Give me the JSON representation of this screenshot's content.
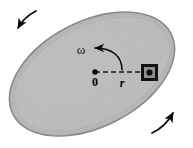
{
  "figure": {
    "type": "physics-diagram",
    "canvas": {
      "width": 193,
      "height": 148,
      "background": "#ffffff"
    }
  },
  "disk": {
    "name": "rotating-disk",
    "shape": "ellipse",
    "center_x": 92,
    "center_y": 74,
    "radius_x": 88,
    "radius_y": 52,
    "rotation_deg": -27,
    "fill_color": "#b9b9b9",
    "rim_color": "#8a8a8a",
    "rim_width": 4,
    "texture": "speckled-gray"
  },
  "origin": {
    "name": "disk-center",
    "label": "0",
    "x": 95,
    "y": 72,
    "dot_radius": 2.6,
    "color": "#000000"
  },
  "radius": {
    "name": "radius-line",
    "label": "r",
    "from_x": 95,
    "from_y": 72,
    "to_x": 146,
    "to_y": 72,
    "style": "dashed",
    "color": "#1a1a1a",
    "label_x": 122,
    "label_y": 85
  },
  "block": {
    "name": "sliding-block",
    "x": 141,
    "y": 64,
    "width": 17,
    "height": 17,
    "outer_color": "#111111",
    "inner_color": "#8f8f8f",
    "center_dot_color": "#0d0d0d"
  },
  "angular_velocity": {
    "name": "angular-velocity-arrow",
    "label": "ω",
    "label_x": 81,
    "label_y": 53,
    "arc_start_x": 122,
    "arc_start_y": 70,
    "arc_end_x": 93,
    "arc_end_y": 48,
    "color": "#0b0b0b",
    "direction": "counterclockwise"
  },
  "rotation_arrows": [
    {
      "name": "rotation-arrow-top-left",
      "position": "top-left",
      "color": "#0b0b0b",
      "direction": "down-left"
    },
    {
      "name": "rotation-arrow-bottom-right",
      "position": "bottom-right",
      "color": "#0b0b0b",
      "direction": "up-right"
    }
  ],
  "colors": {
    "ink": "#000000",
    "disk_fill": "#b9b9b9",
    "disk_rim": "#8a8a8a",
    "background": "#ffffff"
  }
}
